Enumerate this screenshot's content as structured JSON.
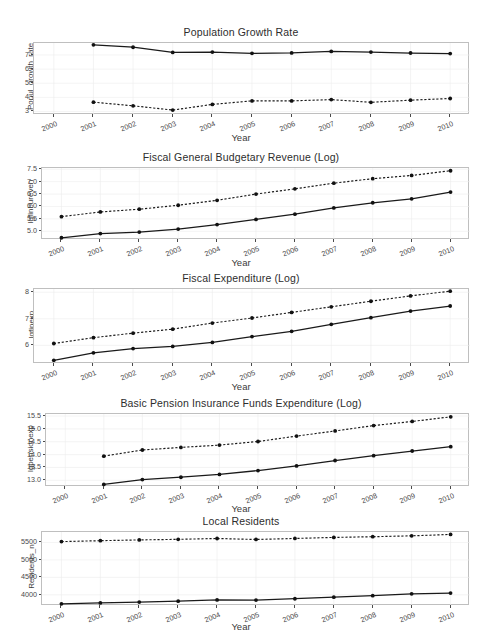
{
  "figure": {
    "xlabel": "Year",
    "background": "#ffffff",
    "panel_border_color": "#bfbfbf",
    "line_color": "#1a1a1a",
    "grid": "minimal-light"
  },
  "chart_data": [
    {
      "type": "line",
      "title": "Population Growth Rate",
      "xlabel": "Year",
      "ylabel": "Popul_growth_rate",
      "x": [
        2000,
        2001,
        2002,
        2003,
        2004,
        2005,
        2006,
        2007,
        2008,
        2009,
        2010
      ],
      "xticks": [
        "2000",
        "2001",
        "2002",
        "2003",
        "2004",
        "2005",
        "2006",
        "2007",
        "2008",
        "2009",
        "2010"
      ],
      "yticks": [
        3,
        4,
        5,
        6,
        7
      ],
      "ytick_labels": [
        "3",
        "4",
        "5",
        "6",
        "7"
      ],
      "ylim": [
        2.75,
        7.85
      ],
      "xlim": [
        1999.5,
        2010.5
      ],
      "grid": true,
      "legend": "none",
      "series": [
        {
          "name": "solid",
          "style": "solid",
          "x": [
            2001,
            2002,
            2003,
            2004,
            2005,
            2006,
            2007,
            2008,
            2009,
            2010
          ],
          "values": [
            7.72,
            7.55,
            7.18,
            7.21,
            7.12,
            7.15,
            7.25,
            7.21,
            7.14,
            7.1
          ]
        },
        {
          "name": "dashed",
          "style": "dashed",
          "x": [
            2001,
            2002,
            2003,
            2004,
            2005,
            2006,
            2007,
            2008,
            2009,
            2010
          ],
          "values": [
            3.66,
            3.4,
            3.1,
            3.5,
            3.75,
            3.75,
            3.84,
            3.65,
            3.8,
            3.92
          ]
        }
      ]
    },
    {
      "type": "line",
      "title": "Fiscal General Budgetary Revenue (Log)",
      "xlabel": "Year",
      "ylabel": "lgfinbureven",
      "x": [
        2000,
        2001,
        2002,
        2003,
        2004,
        2005,
        2006,
        2007,
        2008,
        2009,
        2010
      ],
      "xticks": [
        "2000",
        "2001",
        "2002",
        "2003",
        "2004",
        "2005",
        "2006",
        "2007",
        "2008",
        "2009",
        "2010"
      ],
      "yticks": [
        5.0,
        5.5,
        6.0,
        6.5,
        7.0,
        7.5
      ],
      "ytick_labels": [
        "5.0",
        "5.5",
        "6.0",
        "6.5",
        "7.0",
        "7.5"
      ],
      "ylim": [
        4.65,
        7.55
      ],
      "xlim": [
        1999.5,
        2010.5
      ],
      "grid": true,
      "legend": "none",
      "series": [
        {
          "name": "solid",
          "style": "solid",
          "x": [
            2000,
            2001,
            2002,
            2003,
            2004,
            2005,
            2006,
            2007,
            2008,
            2009,
            2010
          ],
          "values": [
            4.74,
            4.91,
            4.97,
            5.09,
            5.27,
            5.48,
            5.69,
            5.94,
            6.15,
            6.31,
            6.58
          ]
        },
        {
          "name": "dashed",
          "style": "dashed",
          "x": [
            2000,
            2001,
            2002,
            2003,
            2004,
            2005,
            2006,
            2007,
            2008,
            2009,
            2010
          ],
          "values": [
            5.59,
            5.78,
            5.89,
            6.05,
            6.25,
            6.5,
            6.71,
            6.94,
            7.12,
            7.25,
            7.44
          ]
        }
      ]
    },
    {
      "type": "line",
      "title": "Fiscal Expenditure (Log)",
      "xlabel": "Year",
      "ylabel": "lgfinexp",
      "x": [
        2000,
        2001,
        2002,
        2003,
        2004,
        2005,
        2006,
        2007,
        2008,
        2009,
        2010
      ],
      "xticks": [
        "2000",
        "2001",
        "2002",
        "2003",
        "2004",
        "2005",
        "2006",
        "2007",
        "2008",
        "2009",
        "2010"
      ],
      "yticks": [
        6,
        7,
        8
      ],
      "ytick_labels": [
        "6",
        "7",
        "8"
      ],
      "ylim": [
        5.3,
        8.12
      ],
      "xlim": [
        1999.5,
        2010.5
      ],
      "grid": true,
      "legend": "none",
      "series": [
        {
          "name": "solid",
          "style": "solid",
          "x": [
            2000,
            2001,
            2002,
            2003,
            2004,
            2005,
            2006,
            2007,
            2008,
            2009,
            2010
          ],
          "values": [
            5.44,
            5.72,
            5.88,
            5.96,
            6.11,
            6.33,
            6.53,
            6.79,
            7.04,
            7.29,
            7.48
          ]
        },
        {
          "name": "dashed",
          "style": "dashed",
          "x": [
            2000,
            2001,
            2002,
            2003,
            2004,
            2005,
            2006,
            2007,
            2008,
            2009,
            2010
          ],
          "values": [
            6.07,
            6.29,
            6.46,
            6.61,
            6.84,
            7.03,
            7.24,
            7.45,
            7.66,
            7.86,
            8.04
          ]
        }
      ]
    },
    {
      "type": "line",
      "title": "Basic Pension Insurance Funds Expenditure (Log)",
      "xlabel": "Year",
      "ylabel": "lgpensionexp",
      "x": [
        2000,
        2001,
        2002,
        2003,
        2004,
        2005,
        2006,
        2007,
        2008,
        2009,
        2010
      ],
      "xticks": [
        "2000",
        "2001",
        "2002",
        "2003",
        "2004",
        "2005",
        "2006",
        "2007",
        "2008",
        "2009",
        "2010"
      ],
      "yticks": [
        13.0,
        13.5,
        14.0,
        14.5,
        15.0,
        15.5
      ],
      "ytick_labels": [
        "13.0",
        "13.5",
        "14.0",
        "14.5",
        "15.0",
        "15.5"
      ],
      "ylim": [
        12.74,
        15.58
      ],
      "xlim": [
        1999.5,
        2010.5
      ],
      "grid": true,
      "legend": "none",
      "series": [
        {
          "name": "solid",
          "style": "solid",
          "x": [
            2001,
            2002,
            2003,
            2004,
            2005,
            2006,
            2007,
            2008,
            2009,
            2010
          ],
          "values": [
            12.84,
            13.03,
            13.12,
            13.23,
            13.38,
            13.56,
            13.77,
            13.96,
            14.14,
            14.31
          ]
        },
        {
          "name": "dashed",
          "style": "dashed",
          "x": [
            2001,
            2002,
            2003,
            2004,
            2005,
            2006,
            2007,
            2008,
            2009,
            2010
          ],
          "values": [
            13.94,
            14.18,
            14.28,
            14.37,
            14.51,
            14.72,
            14.92,
            15.13,
            15.29,
            15.47
          ]
        }
      ]
    },
    {
      "type": "line",
      "title": "Local Residents",
      "xlabel": "Year",
      "ylabel": "Residents_n",
      "x": [
        2000,
        2001,
        2002,
        2003,
        2004,
        2005,
        2006,
        2007,
        2008,
        2009,
        2010
      ],
      "xticks": [
        "2000",
        "2001",
        "2002",
        "2003",
        "2004",
        "2005",
        "2006",
        "2007",
        "2008",
        "2009",
        "2010"
      ],
      "yticks": [
        4000,
        4500,
        5000,
        5500
      ],
      "ytick_labels": [
        "4000",
        "4500",
        "5000",
        "5500"
      ],
      "ylim": [
        3680,
        5800
      ],
      "xlim": [
        1999.5,
        2010.5
      ],
      "grid": true,
      "legend": "none",
      "series": [
        {
          "name": "solid",
          "style": "solid",
          "x": [
            2000,
            2001,
            2002,
            2003,
            2004,
            2005,
            2006,
            2007,
            2008,
            2009,
            2010
          ],
          "values": [
            3742,
            3768,
            3793,
            3818,
            3853,
            3849,
            3888,
            3932,
            3975,
            4030,
            4050
          ]
        },
        {
          "name": "dashed",
          "style": "dashed",
          "x": [
            2000,
            2001,
            2002,
            2003,
            2004,
            2005,
            2006,
            2007,
            2008,
            2009,
            2010
          ],
          "values": [
            5525,
            5551,
            5573,
            5590,
            5614,
            5586,
            5615,
            5645,
            5665,
            5690,
            5730
          ]
        }
      ]
    }
  ]
}
